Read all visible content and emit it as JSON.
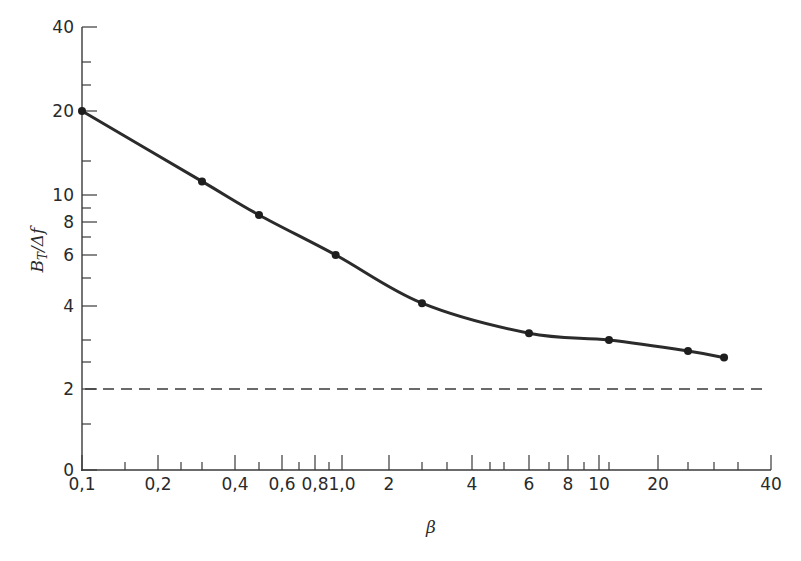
{
  "chart_data": {
    "type": "line",
    "title": "",
    "xlabel": "β",
    "ylabel": "B_T/Δf",
    "ylabel_main": "B",
    "ylabel_sub": "T",
    "ylabel_rest": "/Δf",
    "x_scale": "log",
    "y_scale": "nonlinear",
    "xlim": [
      0.1,
      40
    ],
    "ylim": [
      0,
      40
    ],
    "grid": false,
    "legend": null,
    "x_ticks": [
      {
        "value": 0.1,
        "label": "0,1",
        "major": true
      },
      {
        "value": 0.15,
        "label": "",
        "major": false
      },
      {
        "value": 0.2,
        "label": "0,2",
        "major": true
      },
      {
        "value": 0.25,
        "label": "",
        "major": false
      },
      {
        "value": 0.3,
        "label": "",
        "major": false
      },
      {
        "value": 0.4,
        "label": "0,4",
        "major": true
      },
      {
        "value": 0.5,
        "label": "",
        "major": false
      },
      {
        "value": 0.6,
        "label": "0,6",
        "major": true
      },
      {
        "value": 0.7,
        "label": "",
        "major": false
      },
      {
        "value": 0.8,
        "label": "0,8",
        "major": true
      },
      {
        "value": 0.9,
        "label": "",
        "major": false
      },
      {
        "value": 1.0,
        "label": "1,0",
        "major": true
      },
      {
        "value": 2,
        "label": "2",
        "major": true
      },
      {
        "value": 2.5,
        "label": "",
        "major": false
      },
      {
        "value": 3,
        "label": "",
        "major": false
      },
      {
        "value": 4,
        "label": "4",
        "major": true
      },
      {
        "value": 4.5,
        "label": "",
        "major": false
      },
      {
        "value": 5,
        "label": "",
        "major": false
      },
      {
        "value": 6,
        "label": "6",
        "major": true
      },
      {
        "value": 7,
        "label": "",
        "major": false
      },
      {
        "value": 8,
        "label": "8",
        "major": true
      },
      {
        "value": 9,
        "label": "",
        "major": false
      },
      {
        "value": 10,
        "label": "10",
        "major": true
      },
      {
        "value": 11,
        "label": "",
        "major": false
      },
      {
        "value": 20,
        "label": "20",
        "major": true
      },
      {
        "value": 25,
        "label": "",
        "major": false
      },
      {
        "value": 30,
        "label": "",
        "major": false
      },
      {
        "value": 35,
        "label": "",
        "major": false
      },
      {
        "value": 40,
        "label": "40",
        "major": true
      }
    ],
    "y_ticks": [
      {
        "value": 0,
        "label": "0",
        "major": true
      },
      {
        "value": 1,
        "label": "",
        "major": false
      },
      {
        "value": 2,
        "label": "2",
        "major": true
      },
      {
        "value": 2.5,
        "label": "",
        "major": false
      },
      {
        "value": 3,
        "label": "",
        "major": false
      },
      {
        "value": 4,
        "label": "4",
        "major": true
      },
      {
        "value": 5,
        "label": "",
        "major": false
      },
      {
        "value": 6,
        "label": "6",
        "major": true
      },
      {
        "value": 7,
        "label": "",
        "major": false
      },
      {
        "value": 8,
        "label": "8",
        "major": true
      },
      {
        "value": 9,
        "label": "",
        "major": false
      },
      {
        "value": 10,
        "label": "10",
        "major": true
      },
      {
        "value": 15,
        "label": "",
        "major": false
      },
      {
        "value": 20,
        "label": "20",
        "major": true
      },
      {
        "value": 25,
        "label": "",
        "major": false
      },
      {
        "value": 30,
        "label": "",
        "major": false
      },
      {
        "value": 40,
        "label": "40",
        "major": true
      }
    ],
    "series": [
      {
        "name": "B_T/Δf vs β (measured)",
        "style": "solid line with dot markers",
        "color": "#2b2b2b",
        "x": [
          0.1,
          0.3,
          0.5,
          0.95,
          2.5,
          6,
          11,
          25,
          32
        ],
        "y": [
          20,
          12,
          8.5,
          6,
          4.1,
          3.2,
          3.0,
          2.75,
          2.6
        ]
      },
      {
        "name": "asymptote",
        "style": "dashed",
        "color": "#3a3a3a",
        "x": [
          0.1,
          40
        ],
        "y": [
          2,
          2
        ]
      }
    ]
  },
  "pixel_map": {
    "x": [
      [
        0.1,
        82
      ],
      [
        0.15,
        125
      ],
      [
        0.2,
        158
      ],
      [
        0.25,
        181
      ],
      [
        0.3,
        202
      ],
      [
        0.4,
        235
      ],
      [
        0.5,
        259
      ],
      [
        0.6,
        282
      ],
      [
        0.7,
        299
      ],
      [
        0.8,
        315
      ],
      [
        0.9,
        329
      ],
      [
        1.0,
        342
      ],
      [
        2,
        389
      ],
      [
        2.5,
        422
      ],
      [
        3,
        447
      ],
      [
        4,
        472
      ],
      [
        4.5,
        490
      ],
      [
        5,
        504
      ],
      [
        6,
        529
      ],
      [
        7,
        549
      ],
      [
        8,
        568
      ],
      [
        9,
        584
      ],
      [
        10,
        599
      ],
      [
        11,
        609
      ],
      [
        20,
        658
      ],
      [
        25,
        688
      ],
      [
        30,
        714
      ],
      [
        35,
        738
      ],
      [
        40,
        771
      ]
    ],
    "y": [
      [
        0,
        470
      ],
      [
        1,
        424
      ],
      [
        2,
        389
      ],
      [
        2.5,
        362
      ],
      [
        3,
        340
      ],
      [
        4,
        306
      ],
      [
        5,
        278
      ],
      [
        6,
        255
      ],
      [
        7,
        237
      ],
      [
        8,
        222
      ],
      [
        9,
        208
      ],
      [
        10,
        195
      ],
      [
        15,
        161
      ],
      [
        20,
        111
      ],
      [
        25,
        85
      ],
      [
        30,
        62
      ],
      [
        40,
        27
      ]
    ]
  }
}
